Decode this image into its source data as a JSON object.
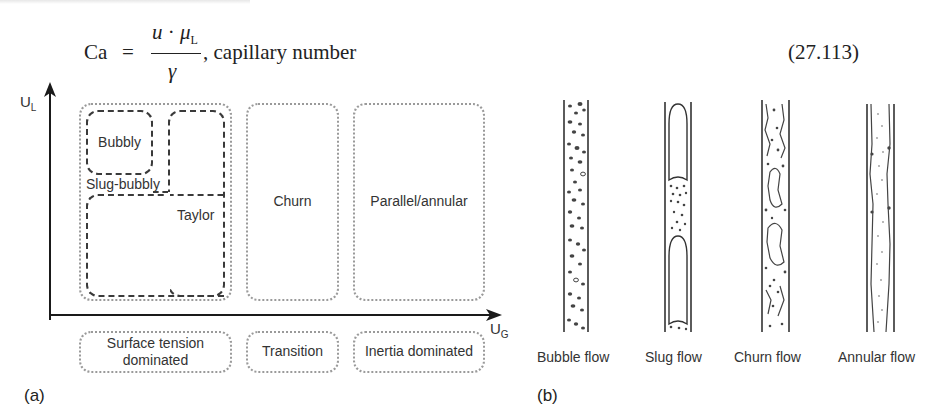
{
  "equation": {
    "lhs": "Ca",
    "equals": "=",
    "numerator_u": "u",
    "numerator_dot": "·",
    "numerator_mu": "μ",
    "numerator_sub": "L",
    "denominator": "γ",
    "suffix": ", capillary number",
    "number": "(27.113)"
  },
  "panel_a": {
    "tag": "(a)",
    "y_axis": {
      "label": "U",
      "sub": "L"
    },
    "x_axis": {
      "label": "U",
      "sub": "G"
    },
    "regimes": {
      "bubbly": "Bubbly",
      "slug_bubbly": "Slug-bubbly",
      "taylor": "Taylor",
      "churn": "Churn",
      "parallel_annular": "Parallel/annular"
    },
    "domains": {
      "surface_tension_line1": "Surface tension",
      "surface_tension_line2": "dominated",
      "transition": "Transition",
      "inertia": "Inertia dominated"
    }
  },
  "panel_b": {
    "tag": "(b)",
    "tubes": [
      {
        "label": "Bubble flow"
      },
      {
        "label": "Slug flow"
      },
      {
        "label": "Churn flow"
      },
      {
        "label": "Annular flow"
      }
    ]
  },
  "colors": {
    "ink": "#1a1a1a",
    "dotted_border": "#9a9a9a",
    "dashed_border": "#3a3a3a",
    "background": "#ffffff"
  }
}
